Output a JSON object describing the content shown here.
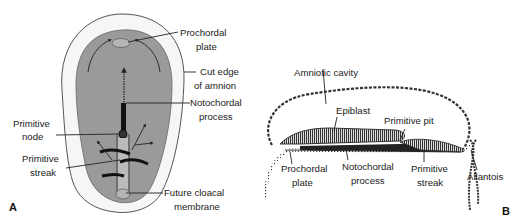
{
  "panel_a": {
    "letter": "A",
    "labels": {
      "prochordal_plate_1": "Prochordal",
      "prochordal_plate_2": "plate",
      "cut_edge_1": "Cut edge",
      "cut_edge_2": "of amnion",
      "notochordal_process_1": "Notochordal",
      "notochordal_process_2": "process",
      "primitive_node_1": "Primitive",
      "primitive_node_2": "node",
      "primitive_streak_1": "Primitive",
      "primitive_streak_2": "streak",
      "future_cloacal_1": "Future cloacal",
      "future_cloacal_2": "membrane"
    }
  },
  "panel_b": {
    "letter": "B",
    "labels": {
      "amniotic_cavity": "Amniotic cavity",
      "epiblast": "Epiblast",
      "primitive_pit": "Primitive pit",
      "prochordal_plate_1": "Prochordal",
      "prochordal_plate_2": "plate",
      "notochordal_process_1": "Notochordal",
      "notochordal_process_2": "process",
      "primitive_streak_1": "Primitive",
      "primitive_streak_2": "streak",
      "allantois": "Allantois"
    }
  },
  "colors": {
    "disc_fill": "#9a9a9a",
    "amnion_fill": "#f4f4f4",
    "ink": "#222222"
  }
}
